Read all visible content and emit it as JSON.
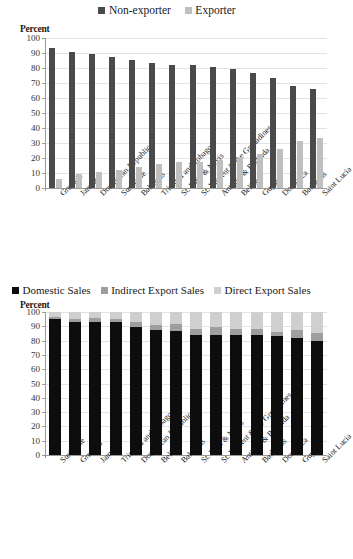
{
  "chart_data": [
    {
      "id": "exporter-status",
      "type": "bar",
      "title": "",
      "ylabel": "Percent",
      "xlabel": "",
      "ylim": [
        0,
        100
      ],
      "ytick_step": 10,
      "yticks": [
        "0",
        "10",
        "20",
        "30",
        "40",
        "50",
        "60",
        "70",
        "80",
        "90",
        "100"
      ],
      "grid": true,
      "legend_position": "top-center",
      "legend": [
        "Non-exporter",
        "Exporter"
      ],
      "colors": {
        "Non-exporter": "#4a4a4a",
        "Exporter": "#bfbfbf"
      },
      "categories": [
        "Grenada",
        "Jamaica",
        "Dominican Republic",
        "Suriname",
        "Bahamas",
        "Trinidad and Tobago",
        "St. Kitts & Nevis",
        "St. Vincent & the Grenadines",
        "Antigua & Barbuda",
        "Belize",
        "Guyana",
        "Dominica",
        "Barbados",
        "Saint Lucia"
      ],
      "series": [
        {
          "name": "Non-exporter",
          "values": [
            93.5,
            90.5,
            89.3,
            87.5,
            85.6,
            83.2,
            82.2,
            81.9,
            80.7,
            79.1,
            76.6,
            73.2,
            67.8,
            65.8
          ]
        },
        {
          "name": "Exporter",
          "values": [
            6.3,
            9.4,
            10.5,
            11.7,
            13.9,
            15.9,
            17.2,
            17.5,
            18.9,
            20.4,
            22.6,
            26.0,
            31.5,
            33.4
          ]
        }
      ]
    },
    {
      "id": "sales-destination",
      "type": "bar",
      "subtype": "stacked",
      "title": "",
      "ylabel": "Percent",
      "xlabel": "",
      "ylim": [
        0,
        100
      ],
      "ytick_step": 10,
      "yticks": [
        "0",
        "10",
        "20",
        "30",
        "40",
        "50",
        "60",
        "70",
        "80",
        "90",
        "100"
      ],
      "grid": true,
      "legend_position": "top-left",
      "legend": [
        "Domestic Sales",
        "Indirect Export Sales",
        "Direct Export Sales"
      ],
      "colors": {
        "Domestic Sales": "#0d0d0d",
        "Indirect Export Sales": "#9e9e9e",
        "Direct Export Sales": "#cfcfcf"
      },
      "categories": [
        "Suriname",
        "Grenada",
        "Jamaica",
        "Trinidad and Tobago",
        "Dominican Republic",
        "Belize",
        "Bahamas",
        "St. Kitts & Nevis",
        "St. Vincent & the Grenadines",
        "Antigua & Barbuda",
        "Barbados",
        "Dominica",
        "Guyana",
        "Saint Lucia"
      ],
      "series": [
        {
          "name": "Domestic Sales",
          "values": [
            95.0,
            93.1,
            93.0,
            92.9,
            89.6,
            87.4,
            86.7,
            84.2,
            84.1,
            84.0,
            83.9,
            83.1,
            82.1,
            79.7
          ]
        },
        {
          "name": "Indirect Export Sales",
          "values": [
            1.8,
            2.2,
            2.6,
            2.4,
            3.4,
            3.6,
            4.6,
            4.2,
            5.2,
            4.4,
            4.0,
            3.0,
            5.3,
            5.8
          ]
        },
        {
          "name": "Direct Export Sales",
          "values": [
            3.2,
            4.7,
            4.4,
            4.7,
            7.0,
            9.0,
            8.7,
            11.6,
            10.7,
            11.6,
            12.1,
            13.9,
            12.6,
            14.5
          ]
        }
      ]
    }
  ]
}
